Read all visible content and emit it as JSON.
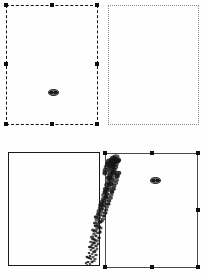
{
  "figure": {
    "title": "",
    "width": 205,
    "height": 277,
    "background": "#fefefe",
    "layout": "2x2-panel-grid"
  },
  "colors": {
    "ink": "#1a1a1a",
    "dashed_border": "#111111",
    "dotted_border": "#8d8d8d",
    "solid_border": "#1a1a1a",
    "gray_border": "#4a4a4a",
    "handle": "#0d0d0d",
    "marker_fill": "#6e6e6e",
    "background": "#fefefe"
  },
  "panels": [
    {
      "id": "panel-top-left",
      "name": "top-left-panel",
      "border_style": "dashed",
      "border_color": "#111111",
      "selected": true,
      "x": 6,
      "y": 5,
      "width": 92,
      "height": 120,
      "has_center_marker": true,
      "marker": {
        "x": 53,
        "y": 92,
        "shape": "oval"
      },
      "handles": [
        {
          "name": "handle-top-left",
          "x": 4,
          "y": 3
        },
        {
          "name": "handle-top-center",
          "x": 50,
          "y": 3
        },
        {
          "name": "handle-top-right",
          "x": 95,
          "y": 3
        },
        {
          "name": "handle-mid-left",
          "x": 4,
          "y": 62
        },
        {
          "name": "handle-mid-right",
          "x": 95,
          "y": 62
        },
        {
          "name": "handle-bottom-left",
          "x": 4,
          "y": 122
        },
        {
          "name": "handle-bottom-center",
          "x": 50,
          "y": 122
        },
        {
          "name": "handle-bottom-right",
          "x": 95,
          "y": 122
        }
      ]
    },
    {
      "id": "panel-top-right",
      "name": "top-right-panel",
      "border_style": "dotted",
      "border_color": "#8d8d8d",
      "selected": false,
      "x": 108,
      "y": 5,
      "width": 91,
      "height": 120,
      "has_center_marker": false,
      "handles": []
    },
    {
      "id": "panel-bottom-left",
      "name": "bottom-left-panel",
      "border_style": "solid",
      "border_color": "#1a1a1a",
      "selected": false,
      "x": 8,
      "y": 152,
      "width": 92,
      "height": 114,
      "has_center_marker": false,
      "handles": []
    },
    {
      "id": "panel-bottom-right",
      "name": "bottom-right-panel",
      "border_style": "solid",
      "border_color": "#4a4a4a",
      "selected": true,
      "x": 105,
      "y": 153,
      "width": 93,
      "height": 115,
      "has_center_marker": true,
      "marker": {
        "x": 155,
        "y": 180,
        "shape": "oval"
      },
      "handles": [
        {
          "name": "handle-top-left",
          "x": 103,
          "y": 151
        },
        {
          "name": "handle-top-center",
          "x": 150,
          "y": 151
        },
        {
          "name": "handle-top-right",
          "x": 196,
          "y": 151
        },
        {
          "name": "handle-mid-right",
          "x": 196,
          "y": 208
        },
        {
          "name": "handle-bottom-left",
          "x": 103,
          "y": 265
        },
        {
          "name": "handle-bottom-center",
          "x": 150,
          "y": 265
        },
        {
          "name": "handle-bottom-right",
          "x": 196,
          "y": 265
        }
      ]
    }
  ],
  "scatter": {
    "name": "diagonal-ink-streak",
    "description": "dense dark scatter cluster running diagonally from lower-left to upper-right across the bottom two panels",
    "color": "#141414",
    "start": {
      "x": 86,
      "y": 266
    },
    "end": {
      "x": 115,
      "y": 158
    },
    "widest_at": "top",
    "points": [
      [
        87,
        265
      ],
      [
        90,
        264
      ],
      [
        92,
        262
      ],
      [
        88,
        262
      ],
      [
        94,
        261
      ],
      [
        91,
        259
      ],
      [
        86,
        263
      ],
      [
        89,
        258
      ],
      [
        93,
        257
      ],
      [
        95,
        259
      ],
      [
        90,
        256
      ],
      [
        87,
        257
      ],
      [
        92,
        254
      ],
      [
        96,
        255
      ],
      [
        94,
        252
      ],
      [
        89,
        253
      ],
      [
        91,
        250
      ],
      [
        95,
        251
      ],
      [
        93,
        248
      ],
      [
        90,
        247
      ],
      [
        97,
        249
      ],
      [
        92,
        245
      ],
      [
        96,
        246
      ],
      [
        94,
        243
      ],
      [
        91,
        242
      ],
      [
        98,
        244
      ],
      [
        95,
        240
      ],
      [
        93,
        239
      ],
      [
        97,
        241
      ],
      [
        92,
        237
      ],
      [
        96,
        236
      ],
      [
        99,
        238
      ],
      [
        94,
        234
      ],
      [
        98,
        233
      ],
      [
        95,
        231
      ],
      [
        100,
        232
      ],
      [
        97,
        229
      ],
      [
        93,
        230
      ],
      [
        99,
        227
      ],
      [
        96,
        226
      ],
      [
        101,
        228
      ],
      [
        98,
        224
      ],
      [
        95,
        223
      ],
      [
        100,
        222
      ],
      [
        97,
        220
      ],
      [
        102,
        221
      ],
      [
        99,
        218
      ],
      [
        96,
        217
      ],
      [
        103,
        219
      ],
      [
        100,
        215
      ],
      [
        98,
        214
      ],
      [
        104,
        216
      ],
      [
        101,
        212
      ],
      [
        99,
        211
      ],
      [
        105,
        213
      ],
      [
        102,
        209
      ],
      [
        100,
        208
      ],
      [
        106,
        210
      ],
      [
        103,
        206
      ],
      [
        101,
        205
      ],
      [
        107,
        207
      ],
      [
        104,
        203
      ],
      [
        102,
        202
      ],
      [
        108,
        204
      ],
      [
        105,
        200
      ],
      [
        103,
        199
      ],
      [
        109,
        201
      ],
      [
        106,
        197
      ],
      [
        104,
        195
      ],
      [
        110,
        198
      ],
      [
        107,
        194
      ],
      [
        105,
        192
      ],
      [
        111,
        195
      ],
      [
        108,
        190
      ],
      [
        106,
        189
      ],
      [
        112,
        192
      ],
      [
        109,
        187
      ],
      [
        107,
        185
      ],
      [
        113,
        189
      ],
      [
        110,
        184
      ],
      [
        108,
        182
      ],
      [
        114,
        186
      ],
      [
        111,
        180
      ],
      [
        109,
        178
      ],
      [
        115,
        183
      ],
      [
        112,
        177
      ],
      [
        110,
        175
      ],
      [
        113,
        173
      ],
      [
        116,
        180
      ],
      [
        111,
        171
      ],
      [
        114,
        170
      ],
      [
        117,
        176
      ],
      [
        112,
        168
      ],
      [
        115,
        167
      ],
      [
        118,
        173
      ],
      [
        113,
        165
      ],
      [
        116,
        164
      ],
      [
        110,
        166
      ],
      [
        114,
        162
      ],
      [
        117,
        161
      ],
      [
        111,
        163
      ],
      [
        115,
        159
      ],
      [
        118,
        160
      ],
      [
        112,
        160
      ],
      [
        116,
        157
      ],
      [
        113,
        158
      ],
      [
        109,
        161
      ],
      [
        108,
        164
      ],
      [
        107,
        167
      ],
      [
        106,
        170
      ],
      [
        105,
        173
      ]
    ]
  }
}
